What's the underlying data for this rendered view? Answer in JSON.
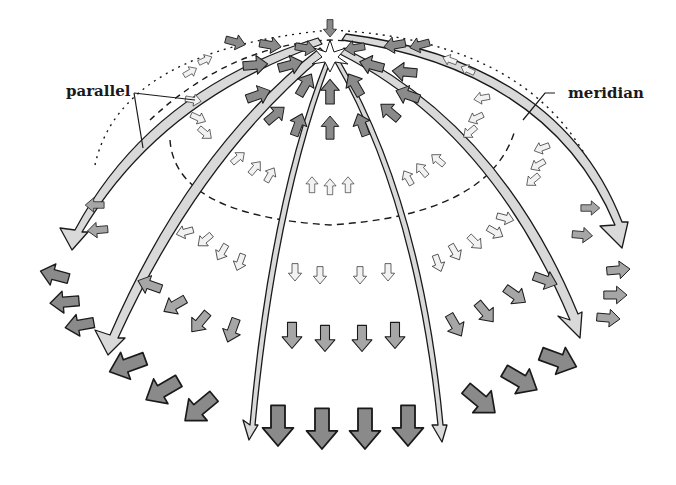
{
  "diagram": {
    "labels": {
      "parallel": "parallel",
      "meridian": "meridian"
    },
    "colors": {
      "background": "#ffffff",
      "outline": "#1a1a1a",
      "arrow_dark": "#8a8a8a",
      "arrow_mid": "#a6a6a6",
      "arrow_light": "#f2f2f2",
      "meridian_band": "#d9d9d9"
    },
    "regions": [
      {
        "name": "crown",
        "arrows": "dark gray, converging toward apex (compression)"
      },
      {
        "name": "upper band",
        "arrows": "white, pointing up along meridians"
      },
      {
        "name": "middle band",
        "arrows": "white, pointing down"
      },
      {
        "name": "lower band",
        "arrows": "gray, pointing down/outward (tension in parallels)"
      },
      {
        "name": "base ring",
        "arrows": "dark gray, large, pointing outward/down"
      }
    ]
  }
}
